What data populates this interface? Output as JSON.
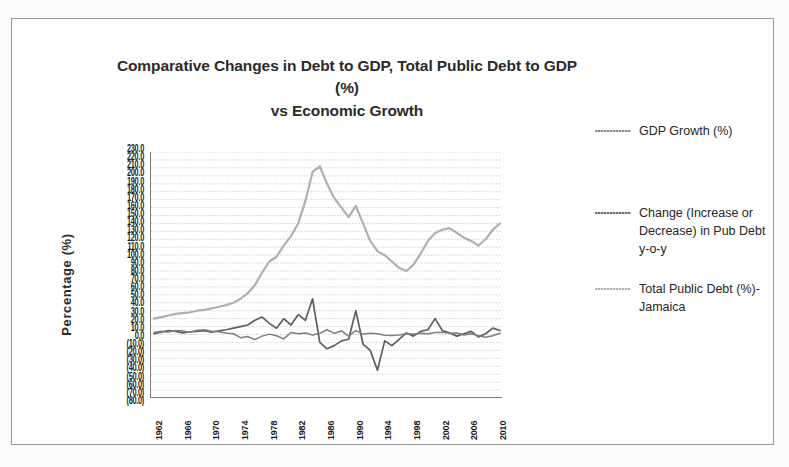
{
  "chart_data": {
    "type": "line",
    "title": "Comparative Changes in Debt to GDP, Total Public Debt to GDP (%) vs Economic Growth",
    "title_line1": "Comparative Changes in Debt to GDP, Total Public Debt to GDP (%)",
    "title_line2": "vs Economic Growth",
    "xlabel": "",
    "ylabel": "Percentage (%)",
    "ylim": [
      -80,
      230
    ],
    "grid": true,
    "legend_position": "right",
    "y_ticks": [
      "230.0",
      "220.0",
      "210.0",
      "200.0",
      "190.0",
      "180.0",
      "170.0",
      "160.0",
      "150.0",
      "140.0",
      "130.0",
      "120.0",
      "110.0",
      "100.0",
      "90.0",
      "80.0",
      "70.0",
      "60.0",
      "50.0",
      "40.0",
      "30.0",
      "20.0",
      "10.0",
      "0.0",
      "(10.0)",
      "(20.0)",
      "(30.0)",
      "(40.0)",
      "(50.0)",
      "(60.0)",
      "(70.0)",
      "(80.0)"
    ],
    "x_tick_labels": [
      "1962",
      "1966",
      "1970",
      "1974",
      "1978",
      "1982",
      "1986",
      "1990",
      "1994",
      "1998",
      "2002",
      "2006",
      "2010"
    ],
    "x_start_year": 1962,
    "x_end_year": 2010,
    "colors": {
      "gdp_growth": "#7f7f7f",
      "change_pub_debt": "#5e5e5e",
      "total_public_debt": "#b0b0b0",
      "gridline": "#c8c8c8",
      "axis": "#7d7d7d",
      "title_text": "#2b2b2b"
    },
    "series": [
      {
        "name": "GDP Growth (%)",
        "key": "gdp_growth",
        "values": [
          2.5,
          4.0,
          3.0,
          5.0,
          4.5,
          3.0,
          5.5,
          6.0,
          4.0,
          3.5,
          2.0,
          1.0,
          -4.0,
          -2.5,
          -6.5,
          -2.0,
          0.5,
          -1.5,
          -5.5,
          2.5,
          1.0,
          2.0,
          -0.5,
          1.5,
          6.0,
          1.5,
          4.5,
          -2.0,
          5.0,
          0.5,
          1.5,
          1.0,
          -1.0,
          -1.2,
          -0.5,
          1.0,
          0.8,
          1.5,
          1.0,
          2.5,
          3.0,
          1.5,
          2.0,
          -0.5,
          1.0,
          -1.5,
          -3.5,
          -1.5,
          1.5
        ]
      },
      {
        "name": "Change (Increase or Decrease) in Pub Debt y-o-y",
        "key": "change_pub_debt",
        "values": [
          1.0,
          3.0,
          5.0,
          4.0,
          2.0,
          3.5,
          4.0,
          5.0,
          3.0,
          4.5,
          6.0,
          8.0,
          10.0,
          12.0,
          18.0,
          22.0,
          14.0,
          8.0,
          20.0,
          12.0,
          25.0,
          18.0,
          45.0,
          -10.0,
          -18.0,
          -14.0,
          -8.0,
          -6.0,
          30.0,
          -12.0,
          -20.0,
          -45.0,
          -8.0,
          -14.0,
          -6.0,
          2.0,
          -2.0,
          4.0,
          6.0,
          20.0,
          5.0,
          2.0,
          -2.0,
          1.0,
          4.0,
          -3.0,
          1.0,
          8.0,
          5.0
        ]
      },
      {
        "name": "Total Public Debt (%)- Jamaica",
        "key": "total_public_debt",
        "values": [
          20.0,
          22.0,
          24.0,
          26.0,
          27.0,
          28.0,
          30.0,
          31.0,
          33.0,
          35.0,
          37.0,
          40.0,
          45.0,
          52.0,
          62.0,
          78.0,
          92.0,
          98.0,
          112.0,
          124.0,
          140.0,
          168.0,
          205.0,
          212.0,
          190.0,
          172.0,
          160.0,
          148.0,
          162.0,
          140.0,
          118.0,
          105.0,
          100.0,
          92.0,
          84.0,
          80.0,
          88.0,
          102.0,
          118.0,
          128.0,
          132.0,
          134.0,
          128.0,
          122.0,
          118.0,
          112.0,
          120.0,
          132.0,
          140.0
        ]
      }
    ],
    "legend_entries": [
      {
        "label": "GDP Growth (%)",
        "swatch": "s1"
      },
      {
        "label": "Change (Increase or Decrease) in Pub Debt y-o-y",
        "swatch": "s2"
      },
      {
        "label": "Total Public Debt (%)- Jamaica",
        "swatch": "s3"
      }
    ]
  }
}
